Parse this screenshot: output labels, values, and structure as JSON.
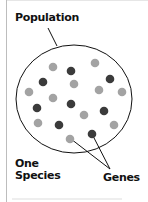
{
  "labels": {
    "population": "Population",
    "species_line1": "One",
    "species_line2": "Species",
    "genes": "Genes"
  },
  "colors": {
    "light_dot": "#a3a3a3",
    "dark_dot": "#3b3b3b",
    "outline": "#111111",
    "frame": "#bdbdbd"
  },
  "diagram": {
    "ellipse": {
      "cx": 74,
      "cy": 99,
      "rx": 58,
      "ry": 54
    },
    "dots": [
      {
        "x": 53,
        "y": 67,
        "tone": "light"
      },
      {
        "x": 71,
        "y": 71,
        "tone": "dark"
      },
      {
        "x": 95,
        "y": 63,
        "tone": "light"
      },
      {
        "x": 43,
        "y": 82,
        "tone": "dark"
      },
      {
        "x": 74,
        "y": 84,
        "tone": "light"
      },
      {
        "x": 110,
        "y": 79,
        "tone": "dark"
      },
      {
        "x": 29,
        "y": 92,
        "tone": "light"
      },
      {
        "x": 99,
        "y": 90,
        "tone": "light"
      },
      {
        "x": 122,
        "y": 92,
        "tone": "light"
      },
      {
        "x": 53,
        "y": 98,
        "tone": "light"
      },
      {
        "x": 37,
        "y": 108,
        "tone": "dark"
      },
      {
        "x": 71,
        "y": 104,
        "tone": "dark"
      },
      {
        "x": 84,
        "y": 115,
        "tone": "light"
      },
      {
        "x": 104,
        "y": 111,
        "tone": "dark"
      },
      {
        "x": 38,
        "y": 123,
        "tone": "light"
      },
      {
        "x": 59,
        "y": 125,
        "tone": "dark"
      },
      {
        "x": 114,
        "y": 125,
        "tone": "light"
      },
      {
        "x": 70,
        "y": 139,
        "tone": "light"
      },
      {
        "x": 92,
        "y": 134,
        "tone": "dark"
      }
    ],
    "pointers": [
      {
        "from": [
          48,
          28
        ],
        "to": [
          57,
          46
        ],
        "target": "population"
      },
      {
        "from": [
          110,
          169
        ],
        "to": [
          71,
          139
        ],
        "target": "genes"
      },
      {
        "from": [
          110,
          169
        ],
        "to": [
          92,
          134
        ],
        "target": "genes"
      }
    ]
  }
}
